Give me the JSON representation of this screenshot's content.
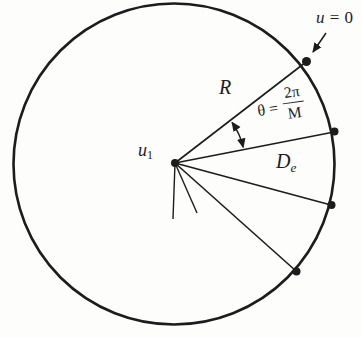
{
  "figure": {
    "ink_color": "#1c1c1c",
    "background_color": "#fdfdfc",
    "labels": {
      "u0_var": "u",
      "u0_eq": " = 0",
      "radius": "R",
      "theta_eq": "θ =",
      "theta_num": "2π",
      "theta_den": "M",
      "distance_base": "D",
      "distance_sub": "e",
      "center_base": "u",
      "center_sub": "1"
    }
  }
}
